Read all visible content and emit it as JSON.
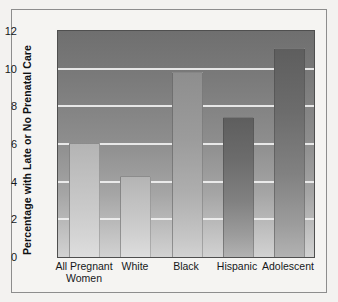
{
  "chart_data": {
    "type": "bar",
    "title": "",
    "subtitle": "",
    "xlabel": "",
    "ylabel": "Percentage with Late or No Prenatal Care",
    "categories": [
      "All Pregnant Women",
      "White",
      "Black",
      "Hispanic",
      "Adolescent"
    ],
    "category_lines": [
      [
        "All Pregnant",
        "Women"
      ],
      [
        "White"
      ],
      [
        "Black"
      ],
      [
        "Hispanic"
      ],
      [
        "Adolescent"
      ]
    ],
    "values": [
      6.0,
      4.25,
      9.75,
      7.4,
      11.05
    ],
    "ylim": [
      0,
      12
    ],
    "yticks": [
      0,
      2,
      4,
      6,
      8,
      10,
      12
    ],
    "ytick_labels": [
      "0",
      "2",
      "4",
      "6",
      "8",
      "10",
      "12"
    ],
    "grid": true,
    "grid_axis": "y",
    "legend": false,
    "legend_position": "none",
    "series": [
      {
        "name": "Percentage with Late or No Prenatal Care",
        "values": [
          6.0,
          4.25,
          9.75,
          7.4,
          11.05
        ]
      }
    ]
  },
  "style": {
    "plot_background_top": "#6f6f6f",
    "plot_background_bottom": "#d2d2d2",
    "gridline_color": "#f0f0f0",
    "axis_color": "#4f4f4f",
    "text_color": "#16181a",
    "figure_background": "#f3f2f0",
    "bar_shades": [
      "light",
      "light",
      "mid",
      "dark",
      "dark"
    ]
  }
}
